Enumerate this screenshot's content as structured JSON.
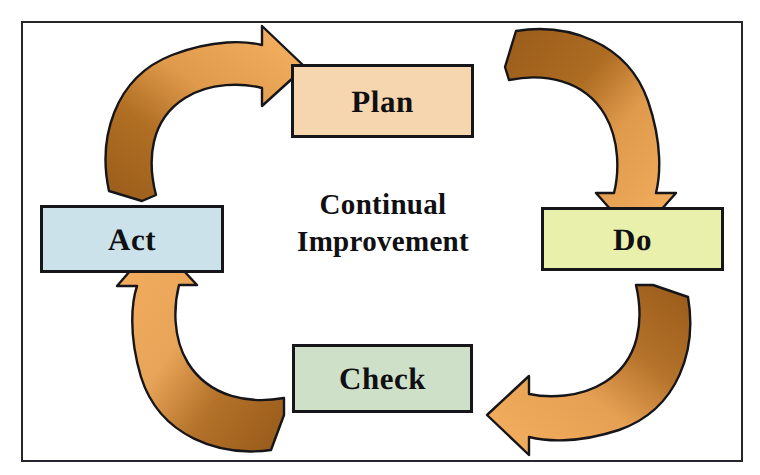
{
  "diagram": {
    "name": "PDCA Continual Improvement Cycle",
    "type": "cycle-diagram",
    "frame": {
      "border_color": "#26262e",
      "background_color": "#ffffff"
    },
    "center": {
      "line1": "Continual",
      "line2": "Improvement"
    },
    "nodes": [
      {
        "id": "plan",
        "label": "Plan",
        "fill": "#f6d6ae",
        "border": "#15151a",
        "position": "top"
      },
      {
        "id": "do",
        "label": "Do",
        "fill": "#e9f0ac",
        "border": "#15151a",
        "position": "right"
      },
      {
        "id": "check",
        "label": "Check",
        "fill": "#cfe0c8",
        "border": "#15151a",
        "position": "bottom"
      },
      {
        "id": "act",
        "label": "Act",
        "fill": "#cce2eb",
        "border": "#15151a",
        "position": "left"
      }
    ],
    "arrows": [
      {
        "id": "act-to-plan",
        "from": "Act",
        "to": "Plan",
        "direction": "clockwise",
        "tail_color": "#a3631f",
        "head_color": "#f0a757",
        "outline_color": "#15151a"
      },
      {
        "id": "plan-to-do",
        "from": "Plan",
        "to": "Do",
        "direction": "clockwise",
        "tail_color": "#a3631f",
        "head_color": "#f0a757",
        "outline_color": "#15151a"
      },
      {
        "id": "do-to-check",
        "from": "Do",
        "to": "Check",
        "direction": "clockwise",
        "tail_color": "#a3631f",
        "head_color": "#f0a757",
        "outline_color": "#15151a"
      },
      {
        "id": "check-to-act",
        "from": "Check",
        "to": "Act",
        "direction": "clockwise",
        "tail_color": "#a3631f",
        "head_color": "#f0a757",
        "outline_color": "#15151a"
      }
    ]
  }
}
